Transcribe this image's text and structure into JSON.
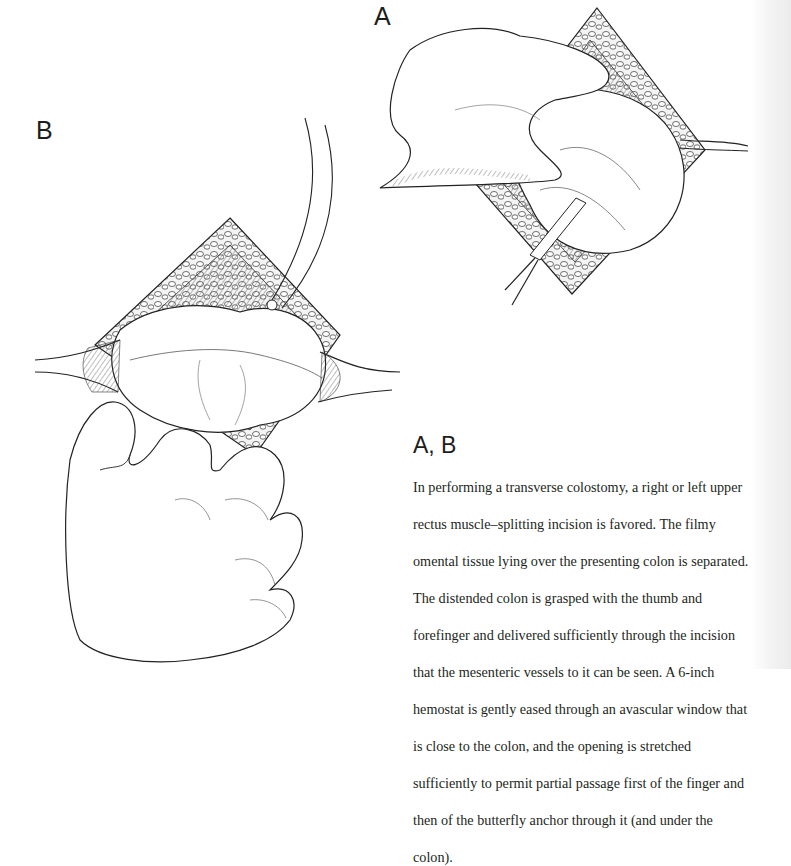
{
  "figures": [
    {
      "label": "A",
      "description": "Hand grasping distended colon through incision; hemostat passed through avascular window"
    },
    {
      "label": "B",
      "description": "Colon delivered through diamond-shaped incision with retractors; hand holding colon; curved butterfly anchor instrument"
    }
  ],
  "caption": {
    "title": "A, B",
    "lines": [
      "In performing a transverse colostomy, a right or left upper",
      "rectus muscle–splitting incision is favored. The filmy",
      "omental tissue lying over the presenting colon is separated.",
      "The distended colon is grasped with the thumb and",
      "forefinger and delivered sufficiently through the incision",
      "that the mesenteric vessels to it can be seen. A 6-inch",
      "hemostat is gently eased through an avascular window that",
      "is close to the colon, and the opening is stretched",
      "sufficiently to permit partial passage first of the finger and",
      "then of the butterfly anchor through it (and under the",
      "colon)."
    ]
  },
  "colors": {
    "ink": "#231f20",
    "paper": "#ffffff"
  }
}
